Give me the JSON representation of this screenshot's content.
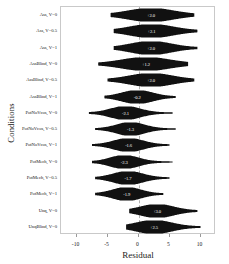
{
  "chart_data": {
    "type": "violin",
    "title": "",
    "xlabel": "Residual",
    "ylabel": "Conditions",
    "xlim": [
      -12.5,
      12.5
    ],
    "xticks": [
      -10,
      -5,
      0,
      5,
      10
    ],
    "xticklabels": [
      "-10",
      "-5",
      "0",
      "5",
      "10"
    ],
    "grid": false,
    "zero_reference_line": true,
    "legend": "none",
    "violin_color": "#111111",
    "label_text_color": "#ffffff",
    "categories": [
      "Ass, V=0",
      "Ass, V=0.5",
      "Ass, V=1",
      "AssBlind, V=0",
      "AssBlind, V=0.5",
      "AssBlind, V=1",
      "PotNoVcos, V=0",
      "PotNoVcos, V=0.5",
      "PotNoVcos, V=1",
      "PotMech, V=0",
      "PotMech, V=0.5",
      "PotMech, V=1",
      "Unq, V=0",
      "UnqBlind, V=0"
    ],
    "series": [
      {
        "name": "Residual distribution",
        "points": [
          {
            "category": "Ass, V=0",
            "center": 2.0,
            "label": "+2.0",
            "half_width": 3.6,
            "tail_left": -4.5,
            "tail_right": 9.0
          },
          {
            "category": "Ass, V=0.5",
            "center": 2.1,
            "label": "+2.1",
            "half_width": 3.4,
            "tail_left": -4.0,
            "tail_right": 9.5
          },
          {
            "category": "Ass, V=1",
            "center": 2.0,
            "label": "+2.0",
            "half_width": 3.2,
            "tail_left": -4.0,
            "tail_right": 9.5
          },
          {
            "category": "AssBlind, V=0",
            "center": 1.2,
            "label": "+1.2",
            "half_width": 3.8,
            "tail_left": -6.5,
            "tail_right": 8.0
          },
          {
            "category": "AssBlind, V=0.5",
            "center": 2.0,
            "label": "+2.0",
            "half_width": 3.4,
            "tail_left": -5.0,
            "tail_right": 9.0
          },
          {
            "category": "AssBlind, V=1",
            "center": -0.2,
            "label": "-0.2",
            "half_width": 2.4,
            "tail_left": -5.5,
            "tail_right": 6.0
          },
          {
            "category": "PotNoVcos, V=0",
            "center": -2.1,
            "label": "-2.1",
            "half_width": 2.3,
            "tail_left": -8.0,
            "tail_right": 5.5
          },
          {
            "category": "PotNoVcos, V=0.5",
            "center": -1.3,
            "label": "-1.3",
            "half_width": 2.2,
            "tail_left": -7.0,
            "tail_right": 6.0
          },
          {
            "category": "PotNoVcos, V=1",
            "center": -1.6,
            "label": "-1.6",
            "half_width": 2.3,
            "tail_left": -7.5,
            "tail_right": 5.0
          },
          {
            "category": "PotMech, V=0",
            "center": -2.3,
            "label": "-2.3",
            "half_width": 2.2,
            "tail_left": -7.5,
            "tail_right": 5.5
          },
          {
            "category": "PotMech, V=0.5",
            "center": -1.7,
            "label": "-1.7",
            "half_width": 2.3,
            "tail_left": -7.0,
            "tail_right": 5.0
          },
          {
            "category": "PotMech, V=1",
            "center": -1.9,
            "label": "-1.9",
            "half_width": 2.2,
            "tail_left": -7.0,
            "tail_right": 4.0
          },
          {
            "category": "Unq, V=0",
            "center": 3.0,
            "label": "+3.0",
            "half_width": 2.6,
            "tail_left": -1.5,
            "tail_right": 9.5
          },
          {
            "category": "UnqBlind, V=0",
            "center": 2.5,
            "label": "+2.5",
            "half_width": 2.8,
            "tail_left": -2.0,
            "tail_right": 10.0
          }
        ]
      }
    ]
  }
}
